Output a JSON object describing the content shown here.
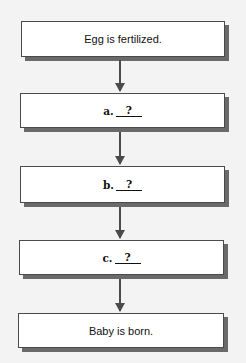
{
  "steps": [
    {
      "type": "text",
      "text": "Egg is fertilized."
    },
    {
      "type": "blank",
      "letter": "a.",
      "placeholder": "?"
    },
    {
      "type": "blank",
      "letter": "b.",
      "placeholder": "?"
    },
    {
      "type": "blank",
      "letter": "c.",
      "placeholder": "?"
    },
    {
      "type": "text",
      "text": "Baby is born."
    }
  ]
}
